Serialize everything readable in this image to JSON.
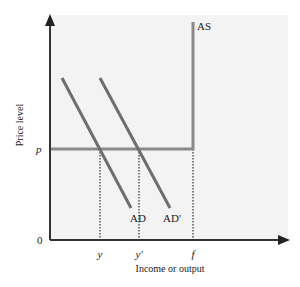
{
  "figure": {
    "type": "AS-AD diagram",
    "y_axis_label": "Price level",
    "x_axis_label": "Income or output",
    "origin_label": "0",
    "price_label": "p",
    "x_ticks": {
      "y": "y",
      "y_prime": "y'",
      "f": "f"
    },
    "curves": {
      "as": {
        "label": "AS",
        "color": "#8a8a8a"
      },
      "ad": {
        "label": "AD",
        "color": "#6e6e6e"
      },
      "ad_prime": {
        "label": "AD'",
        "color": "#6e6e6e"
      }
    },
    "colors": {
      "panel": "#f3f3f3",
      "axis": "#333333",
      "price_line": "#8a8a8a"
    }
  }
}
